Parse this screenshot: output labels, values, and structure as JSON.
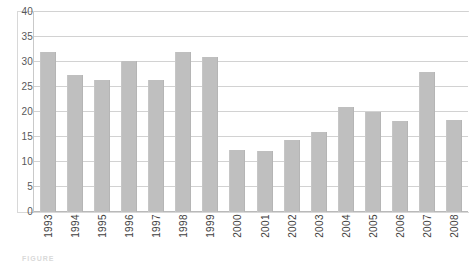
{
  "figure": {
    "caption_partial": "FIGURE"
  },
  "chart_data": {
    "type": "bar",
    "title": "",
    "xlabel": "",
    "ylabel": "",
    "categories": [
      "1993",
      "1994",
      "1995",
      "1996",
      "1997",
      "1998",
      "1999",
      "2000",
      "2001",
      "2002",
      "2003",
      "2004",
      "2005",
      "2006",
      "2007",
      "2008"
    ],
    "values": [
      32,
      27.5,
      26.5,
      30.3,
      26.5,
      32,
      31,
      12.5,
      12.3,
      14.5,
      16,
      21,
      20,
      18.2,
      28,
      18.5
    ],
    "ylim": [
      0,
      40
    ],
    "yticks": [
      0,
      5,
      10,
      15,
      20,
      25,
      30,
      35,
      40
    ],
    "ytick_labels": [
      "0",
      "5",
      "10",
      "15",
      "20",
      "25",
      "30",
      "35",
      "40"
    ],
    "grid": true,
    "legend": false,
    "bar_color": "#bfbfbf",
    "gridline_color": "#d2d2d2",
    "axis_color": "#c9c9c9",
    "tick_label_color": "#58585a"
  }
}
